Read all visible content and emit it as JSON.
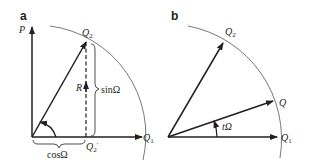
{
  "panels": [
    {
      "id": "a",
      "label": "a",
      "axes": {
        "vertical": "P",
        "horizontal": "Q",
        "horizontal_sub": "1"
      },
      "vector": {
        "name": "Q",
        "sub": "2"
      },
      "projection": {
        "name": "Q",
        "sub": "2",
        "prime": "′"
      },
      "midpoint": "R",
      "sin_label": "sinΩ",
      "cos_label": "cosΩ"
    },
    {
      "id": "b",
      "label": "b",
      "vectors": [
        {
          "name": "Q",
          "sub": "2"
        },
        {
          "name": "Q",
          "sub": ""
        },
        {
          "name": "Q",
          "sub": "1"
        }
      ],
      "angle_label": "tΩ"
    }
  ],
  "colors": {
    "line": "#231f20",
    "arc": "#555555"
  }
}
